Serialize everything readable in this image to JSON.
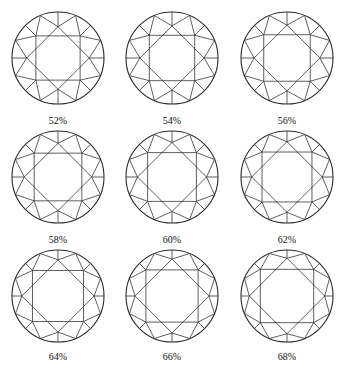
{
  "figure": {
    "colors": {
      "line": "#2a2a2a",
      "background": "#ffffff",
      "text": "#111111"
    },
    "diamonds": [
      {
        "label": "52%",
        "table_pct": 52,
        "row": 0,
        "col": 0
      },
      {
        "label": "54%",
        "table_pct": 54,
        "row": 0,
        "col": 1
      },
      {
        "label": "56%",
        "table_pct": 56,
        "row": 0,
        "col": 2
      },
      {
        "label": "58%",
        "table_pct": 58,
        "row": 1,
        "col": 0
      },
      {
        "label": "60%",
        "table_pct": 60,
        "row": 1,
        "col": 1
      },
      {
        "label": "62%",
        "table_pct": 62,
        "row": 1,
        "col": 2
      },
      {
        "label": "64%",
        "table_pct": 64,
        "row": 2,
        "col": 0
      },
      {
        "label": "66%",
        "table_pct": 66,
        "row": 2,
        "col": 1
      },
      {
        "label": "68%",
        "table_pct": 68,
        "row": 2,
        "col": 2
      }
    ]
  }
}
